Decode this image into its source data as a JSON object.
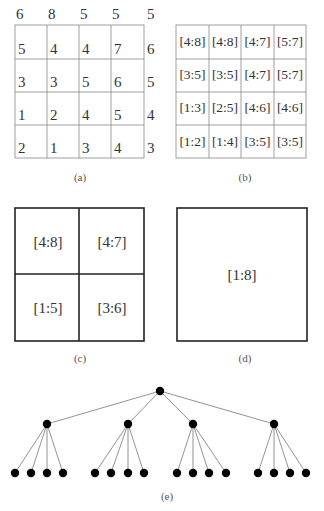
{
  "panels": {
    "a": {
      "caption": "(a)",
      "top_row": [
        "6",
        "8",
        "5",
        "5",
        "5"
      ],
      "right_col": [
        "6",
        "5",
        "4",
        "3"
      ],
      "grid": [
        [
          "5",
          "4",
          "4",
          "7"
        ],
        [
          "3",
          "3",
          "5",
          "6"
        ],
        [
          "1",
          "2",
          "4",
          "5"
        ],
        [
          "2",
          "1",
          "3",
          "4"
        ]
      ]
    },
    "b": {
      "caption": "(b)",
      "grid": [
        [
          "[4:8]",
          "[4:8]",
          "[4:7]",
          "[5:7]"
        ],
        [
          "[3:5]",
          "[3:5]",
          "[4:7]",
          "[5:7]"
        ],
        [
          "[1:3]",
          "[2:5]",
          "[4:6]",
          "[4:6]"
        ],
        [
          "[1:2]",
          "[1:4]",
          "[3:5]",
          "[3:5]"
        ]
      ]
    },
    "c": {
      "caption": "(c)",
      "grid": [
        [
          "[4:8]",
          "[4:7]"
        ],
        [
          "[1:5]",
          "[3:6]"
        ]
      ]
    },
    "d": {
      "caption": "(d)",
      "label": "[1:8]"
    },
    "e": {
      "caption": "(e)",
      "tree": {
        "levels": 3,
        "branching": 4,
        "root_count": 1,
        "mid_count": 4,
        "leaf_count": 16
      }
    }
  },
  "colors": {
    "line": "#333333",
    "thin_line": "#888888",
    "node": "#000000"
  }
}
